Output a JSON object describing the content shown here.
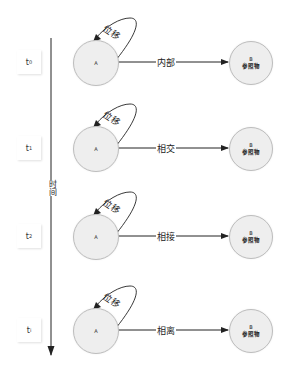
{
  "axis": {
    "label": "时间",
    "direction": "down"
  },
  "rows": [
    {
      "time_label": "t",
      "time_sub": "0",
      "node_a": "A",
      "displacement": "位移",
      "relation": "内部",
      "node_b_name": "B",
      "node_b_caption": "参照物"
    },
    {
      "time_label": "t",
      "time_sub": "1",
      "node_a": "A",
      "displacement": "位移",
      "relation": "相交",
      "node_b_name": "B",
      "node_b_caption": "参照物"
    },
    {
      "time_label": "t",
      "time_sub": "2",
      "node_a": "A",
      "displacement": "位移",
      "relation": "相接",
      "node_b_name": "B",
      "node_b_caption": "参照物"
    },
    {
      "time_label": "t",
      "time_sub": "i",
      "node_a": "A",
      "displacement": "位移",
      "relation": "相离",
      "node_b_name": "B",
      "node_b_caption": "参照物"
    }
  ],
  "colors": {
    "node_fill": "#eeeeee",
    "node_stroke": "#bdbdbd",
    "line": "#222222"
  }
}
